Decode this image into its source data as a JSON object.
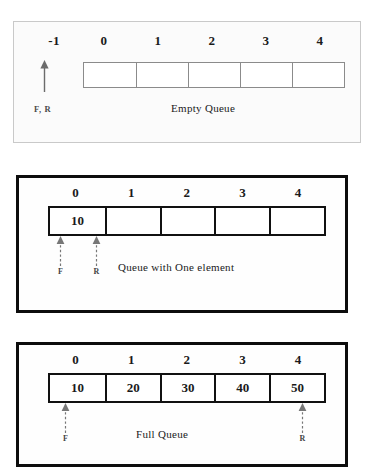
{
  "figure": {
    "panels": [
      {
        "id": "empty-queue",
        "caption": "Empty Queue",
        "indices": [
          "-1",
          "0",
          "1",
          "2",
          "3",
          "4"
        ],
        "cells": [
          "",
          "",
          "",
          "",
          ""
        ],
        "pointer_label": "F, R",
        "pointers": [
          {
            "name": "front-rear",
            "label": "F, R",
            "index": -1
          }
        ]
      },
      {
        "id": "one-element-queue",
        "caption": "Queue with One element",
        "indices": [
          "0",
          "1",
          "2",
          "3",
          "4"
        ],
        "cells": [
          "10",
          "",
          "",
          "",
          ""
        ],
        "pointers": [
          {
            "name": "front",
            "label": "F",
            "index": 0,
            "side": "left"
          },
          {
            "name": "rear",
            "label": "R",
            "index": 0,
            "side": "right"
          }
        ]
      },
      {
        "id": "full-queue",
        "caption": "Full Queue",
        "indices": [
          "0",
          "1",
          "2",
          "3",
          "4"
        ],
        "cells": [
          "10",
          "20",
          "30",
          "40",
          "50"
        ],
        "pointers": [
          {
            "name": "front",
            "label": "F",
            "index": 0,
            "side": "left"
          },
          {
            "name": "rear",
            "label": "R",
            "index": 4,
            "side": "center"
          }
        ]
      }
    ]
  },
  "colors": {
    "page_background": "#ffffff",
    "panel_border_light": "#c9c9c9",
    "panel_border_heavy": "#0d0d0d",
    "cell_border_light": "#8b8b8b",
    "cell_border_heavy": "#111111",
    "text": "#1a1a1a",
    "pointer_text": "#444444"
  }
}
